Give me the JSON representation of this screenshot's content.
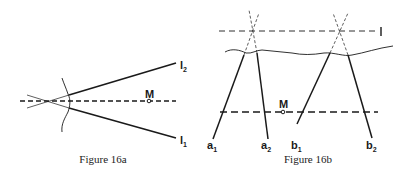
{
  "figures": [
    {
      "id": "16a",
      "caption": "Figure 16a",
      "labels": {
        "point_M": "M",
        "line_upper": {
          "base": "l",
          "sub": "2"
        },
        "line_lower": {
          "base": "l",
          "sub": "1"
        }
      }
    },
    {
      "id": "16b",
      "caption": "Figure 16b",
      "labels": {
        "point_M": "M",
        "line_top": "l",
        "a1": {
          "base": "a",
          "sub": "1"
        },
        "a2": {
          "base": "a",
          "sub": "2"
        },
        "b1": {
          "base": "b",
          "sub": "1"
        },
        "b2": {
          "base": "b",
          "sub": "2"
        }
      }
    }
  ],
  "colors": {
    "ink": "#1a1a1a",
    "background": "#ffffff"
  }
}
